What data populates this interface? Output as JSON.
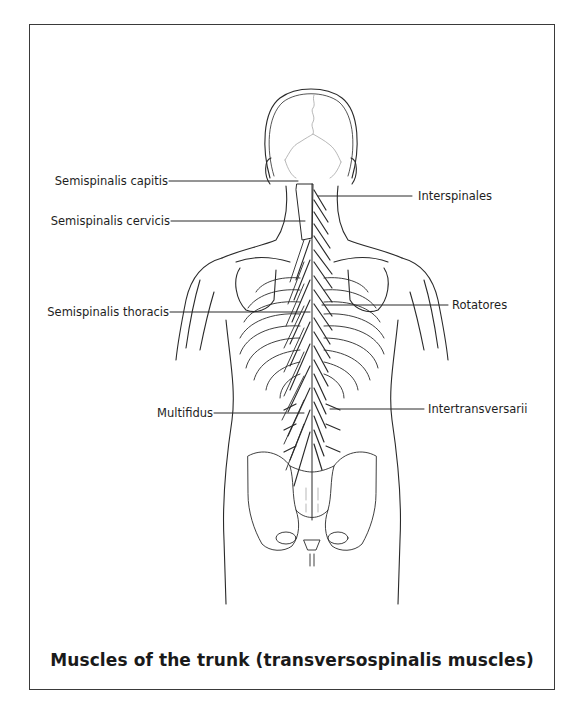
{
  "figure": {
    "caption": "Muscles of the trunk (transversospinalis muscles)",
    "line_color": "#2a2a2a",
    "light_line_color": "#9a9a9a"
  },
  "labels": {
    "semispinalis_capitis": "Semispinalis capitis",
    "semispinalis_cervicis": "Semispinalis cervicis",
    "semispinalis_thoracis": "Semispinalis thoracis",
    "multifidus": "Multifidus",
    "interspinales": "Interspinales",
    "rotatores": "Rotatores",
    "intertransversarii": "Intertransversarii"
  }
}
